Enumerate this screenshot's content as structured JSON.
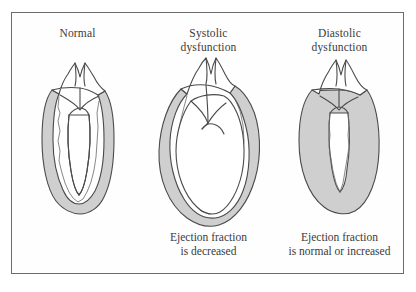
{
  "figure": {
    "kind": "medical-illustration",
    "frame_border_color": "#6b6b6b",
    "background_color": "#ffffff"
  },
  "colors": {
    "myocardium_fill": "#cfcfcf",
    "chamber_fill": "#ffffff",
    "outline": "#4a4a4a",
    "text": "#3b3b3b"
  },
  "panels": [
    {
      "id": "normal",
      "title": "Normal",
      "title_lines": [
        "Normal"
      ],
      "caption": "",
      "caption_lines": [],
      "ventricle": "narrow elongated cavity, normal wall thickness"
    },
    {
      "id": "systolic",
      "title": "Systolic dysfunction",
      "title_lines": [
        "Systolic",
        "dysfunction"
      ],
      "caption": "Ejection fraction is decreased",
      "caption_lines": [
        "Ejection fraction",
        "is decreased"
      ],
      "ventricle": "markedly dilated rounded cavity, thinned wall"
    },
    {
      "id": "diastolic",
      "title": "Diastolic dysfunction",
      "title_lines": [
        "Diastolic",
        "dysfunction"
      ],
      "caption": "Ejection fraction is normal or increased",
      "caption_lines": [
        "Ejection fraction",
        "is normal or increased"
      ],
      "ventricle": "small slit-like cavity, markedly thickened hypertrophied wall"
    }
  ]
}
